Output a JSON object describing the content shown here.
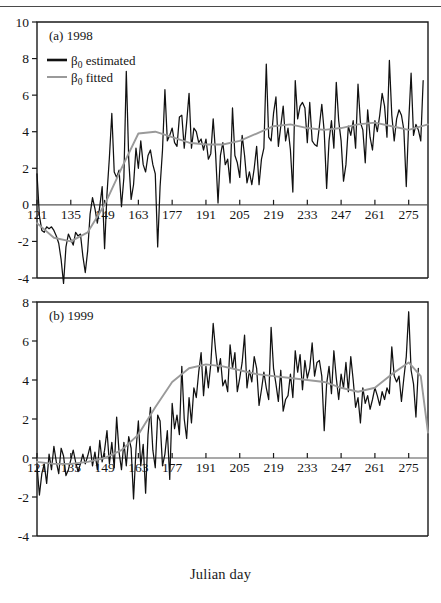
{
  "figure": {
    "xaxis_title": "Julian day",
    "top_rule": true
  },
  "chart_data": [
    {
      "type": "line",
      "title": "(a) 1998",
      "panel_tag": "(a) 1998",
      "xlabel": "Julian day",
      "ylabel": "",
      "xlim": [
        121,
        283
      ],
      "ylim": [
        -4,
        10
      ],
      "yticks": [
        -4,
        -2,
        0,
        2,
        4,
        6,
        8,
        10
      ],
      "xticks": [
        121,
        135,
        149,
        163,
        177,
        191,
        205,
        219,
        233,
        247,
        261,
        275
      ],
      "grid": false,
      "legend_position": "top-left",
      "legend": [
        {
          "name": "β₀ estimated",
          "color": "#111111",
          "width": 2.6
        },
        {
          "name": "β₀ fitted",
          "color": "#9a9a9a",
          "width": 2.0
        }
      ],
      "series": [
        {
          "name": "β₀ estimated",
          "color": "#111111",
          "x": [
            121,
            122,
            123,
            124,
            125,
            126,
            127,
            128,
            129,
            130,
            131,
            132,
            133,
            134,
            135,
            136,
            137,
            138,
            139,
            140,
            141,
            142,
            143,
            144,
            145,
            146,
            147,
            148,
            149,
            150,
            151,
            152,
            153,
            154,
            155,
            156,
            157,
            158,
            159,
            160,
            161,
            162,
            163,
            164,
            165,
            166,
            167,
            168,
            169,
            170,
            171,
            172,
            173,
            174,
            175,
            176,
            177,
            178,
            179,
            180,
            181,
            182,
            183,
            184,
            185,
            186,
            187,
            188,
            189,
            190,
            191,
            192,
            193,
            194,
            195,
            196,
            197,
            198,
            199,
            200,
            201,
            202,
            203,
            204,
            205,
            206,
            207,
            208,
            209,
            210,
            211,
            212,
            213,
            214,
            215,
            216,
            217,
            218,
            219,
            220,
            221,
            222,
            223,
            224,
            225,
            226,
            227,
            228,
            229,
            230,
            231,
            232,
            233,
            234,
            235,
            236,
            237,
            238,
            239,
            240,
            241,
            242,
            243,
            244,
            245,
            246,
            247,
            248,
            249,
            250,
            251,
            252,
            253,
            254,
            255,
            256,
            257,
            258,
            259,
            260,
            261,
            262,
            263,
            264,
            265,
            266,
            267,
            268,
            269,
            270,
            271,
            272,
            273,
            274,
            275,
            276,
            277,
            278,
            279,
            280,
            281,
            282,
            283
          ],
          "values": [
            1.7,
            -0.6,
            -1.4,
            -1.5,
            -1.2,
            -1.3,
            -1.2,
            -1.4,
            -1.7,
            -2.1,
            -3.0,
            -4.3,
            -2.3,
            -1.6,
            -1.9,
            -2.2,
            -1.5,
            -1.7,
            -1.6,
            -2.8,
            -3.7,
            -2.5,
            -0.5,
            0.4,
            -0.2,
            -1.0,
            -0.1,
            1.0,
            -2.4,
            0.6,
            2.6,
            5.0,
            1.8,
            1.5,
            1.9,
            -0.1,
            1.5,
            7.3,
            2.5,
            0.3,
            1.1,
            3.1,
            2.0,
            3.5,
            2.2,
            1.8,
            2.7,
            3.0,
            2.2,
            1.7,
            -2.3,
            1.0,
            3.0,
            6.3,
            3.5,
            3.8,
            4.2,
            3.4,
            3.2,
            4.8,
            4.9,
            3.1,
            4.5,
            6.1,
            3.1,
            4.2,
            4.0,
            3.4,
            3.6,
            3.0,
            3.6,
            2.5,
            2.8,
            4.7,
            2.8,
            0.1,
            2.7,
            3.4,
            2.2,
            2.5,
            1.2,
            5.3,
            2.7,
            2.3,
            1.5,
            3.8,
            2.7,
            1.2,
            1.8,
            1.1,
            2.0,
            3.2,
            1.1,
            2.5,
            3.1,
            7.7,
            3.7,
            3.5,
            5.0,
            5.9,
            3.2,
            4.3,
            5.4,
            3.5,
            4.2,
            3.0,
            0.7,
            6.8,
            4.7,
            5.4,
            5.6,
            5.3,
            3.4,
            5.6,
            3.5,
            3.3,
            3.2,
            4.3,
            5.5,
            4.0,
            0.9,
            3.5,
            4.6,
            3.1,
            6.7,
            4.6,
            3.5,
            1.3,
            2.2,
            4.3,
            3.8,
            4.6,
            3.1,
            6.6,
            4.5,
            4.1,
            2.3,
            5.2,
            3.7,
            3.0,
            4.6,
            4.0,
            4.9,
            6.1,
            5.4,
            3.7,
            7.9,
            4.9,
            3.5,
            4.7,
            5.2,
            4.9,
            4.1,
            1.0,
            4.5,
            7.2,
            3.8,
            4.4,
            4.1,
            3.5,
            6.8
          ]
        },
        {
          "name": "β₀ fitted",
          "color": "#9a9a9a",
          "x": [
            121,
            128,
            135,
            142,
            149,
            156,
            163,
            170,
            177,
            184,
            191,
            198,
            205,
            212,
            219,
            226,
            233,
            240,
            247,
            254,
            261,
            268,
            275,
            283
          ],
          "values": [
            -1.0,
            -1.8,
            -2.0,
            -1.5,
            0.0,
            2.0,
            3.9,
            4.0,
            3.7,
            3.4,
            3.3,
            3.3,
            3.5,
            3.9,
            4.3,
            4.4,
            4.2,
            4.1,
            4.2,
            4.4,
            4.5,
            4.3,
            4.1,
            4.4
          ]
        }
      ]
    },
    {
      "type": "line",
      "title": "(b) 1999",
      "panel_tag": "(b) 1999",
      "xlabel": "Julian day",
      "ylabel": "",
      "xlim": [
        121,
        283
      ],
      "ylim": [
        -4,
        8
      ],
      "yticks": [
        -4,
        -2,
        0,
        2,
        4,
        6,
        8
      ],
      "xticks": [
        121,
        135,
        149,
        163,
        177,
        191,
        205,
        219,
        233,
        247,
        261,
        275
      ],
      "grid": false,
      "legend_position": "none",
      "legend": [],
      "series": [
        {
          "name": "β₀ estimated",
          "color": "#111111",
          "x": [
            121,
            122,
            123,
            124,
            125,
            126,
            127,
            128,
            129,
            130,
            131,
            132,
            133,
            134,
            135,
            136,
            137,
            138,
            139,
            140,
            141,
            142,
            143,
            144,
            145,
            146,
            147,
            148,
            149,
            150,
            151,
            152,
            153,
            154,
            155,
            156,
            157,
            158,
            159,
            160,
            161,
            162,
            163,
            164,
            165,
            166,
            167,
            168,
            169,
            170,
            171,
            172,
            173,
            174,
            175,
            176,
            177,
            178,
            179,
            180,
            181,
            182,
            183,
            184,
            185,
            186,
            187,
            188,
            189,
            190,
            191,
            192,
            193,
            194,
            195,
            196,
            197,
            198,
            199,
            200,
            201,
            202,
            203,
            204,
            205,
            206,
            207,
            208,
            209,
            210,
            211,
            212,
            213,
            214,
            215,
            216,
            217,
            218,
            219,
            220,
            221,
            222,
            223,
            224,
            225,
            226,
            227,
            228,
            229,
            230,
            231,
            232,
            233,
            234,
            235,
            236,
            237,
            238,
            239,
            240,
            241,
            242,
            243,
            244,
            245,
            246,
            247,
            248,
            249,
            250,
            251,
            252,
            253,
            254,
            255,
            256,
            257,
            258,
            259,
            260,
            261,
            262,
            263,
            264,
            265,
            266,
            267,
            268,
            269,
            270,
            271,
            272,
            273,
            274,
            275,
            276,
            277,
            278,
            279,
            280,
            281,
            282,
            283
          ],
          "values": [
            -0.4,
            -1.9,
            -0.8,
            -0.3,
            -1.3,
            0.2,
            -0.6,
            0.6,
            -0.2,
            -0.8,
            0.5,
            0.1,
            -0.9,
            -0.6,
            -0.1,
            0.4,
            -0.2,
            -0.7,
            -0.3,
            0.2,
            -0.3,
            0.1,
            0.6,
            -0.4,
            0.3,
            -0.6,
            0.9,
            -0.2,
            0.4,
            1.4,
            -0.3,
            0.8,
            -0.5,
            2.1,
            0.3,
            -0.6,
            0.8,
            -0.4,
            1.1,
            0.5,
            -2.1,
            0.4,
            1.9,
            -0.4,
            0.7,
            -1.8,
            1.2,
            2.6,
            0.4,
            -0.5,
            2.2,
            1.9,
            -0.4,
            0.2,
            1.4,
            -1.1,
            2.8,
            1.5,
            2.2,
            1.2,
            4.7,
            2.0,
            1.0,
            3.1,
            1.8,
            3.6,
            3.1,
            4.4,
            5.4,
            3.2,
            4.7,
            3.6,
            4.8,
            6.9,
            5.5,
            4.4,
            5.1,
            3.7,
            4.0,
            3.4,
            5.8,
            4.6,
            5.4,
            3.4,
            4.1,
            4.9,
            6.3,
            3.6,
            4.5,
            3.9,
            5.2,
            4.6,
            2.7,
            3.5,
            4.4,
            3.6,
            3.0,
            6.7,
            4.6,
            3.8,
            2.9,
            4.5,
            2.4,
            3.0,
            3.2,
            4.3,
            3.1,
            5.5,
            4.4,
            5.3,
            3.5,
            5.0,
            4.1,
            4.6,
            5.9,
            4.2,
            4.9,
            5.0,
            4.2,
            1.4,
            3.8,
            4.7,
            3.3,
            5.5,
            4.1,
            3.0,
            4.3,
            3.6,
            4.9,
            3.4,
            5.2,
            4.0,
            2.6,
            3.1,
            1.8,
            3.6,
            2.8,
            3.2,
            2.5,
            3.0,
            3.6,
            3.2,
            2.7,
            3.4,
            3.0,
            3.6,
            3.3,
            5.7,
            4.2,
            3.9,
            4.2,
            2.9,
            4.1,
            5.2,
            7.5,
            4.5,
            3.8,
            2.1,
            4.6
          ]
        },
        {
          "name": "β₀ fitted",
          "color": "#9a9a9a",
          "x": [
            121,
            128,
            135,
            142,
            149,
            156,
            163,
            170,
            177,
            184,
            191,
            198,
            205,
            212,
            219,
            226,
            233,
            240,
            247,
            254,
            261,
            268,
            275,
            280,
            283
          ],
          "values": [
            -0.2,
            -0.3,
            -0.3,
            -0.2,
            0.0,
            0.4,
            1.2,
            2.6,
            3.9,
            4.6,
            4.8,
            4.7,
            4.5,
            4.3,
            4.2,
            4.1,
            4.0,
            3.9,
            3.6,
            3.4,
            3.6,
            4.3,
            4.9,
            4.2,
            1.3
          ]
        }
      ]
    }
  ]
}
